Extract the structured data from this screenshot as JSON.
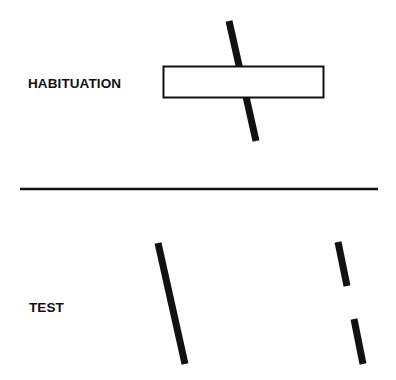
{
  "panels": {
    "habituation": {
      "label": "HABITUATION",
      "description": "A tilted bar partially occluded by a horizontal rectangle"
    },
    "test": {
      "label": "TEST",
      "description": "Left: one continuous tilted bar; Right: two separated tilted bar segments with a gap"
    }
  },
  "colors": {
    "ink": "#111111",
    "background": "#ffffff"
  }
}
